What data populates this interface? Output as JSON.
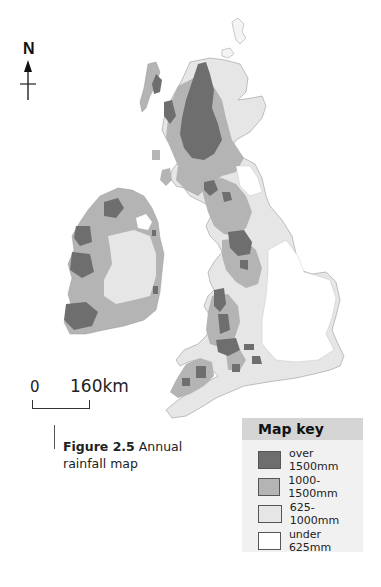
{
  "figure": {
    "number_label": "Figure 2.5",
    "title": "Annual rainfall map"
  },
  "north_arrow": {
    "label": "N"
  },
  "scale_bar": {
    "start_label": "0",
    "end_label": "160km"
  },
  "map_key": {
    "title": "Map key",
    "items": [
      {
        "label": "over 1500mm",
        "color": "#6e6e6e"
      },
      {
        "label": "1000-1500mm",
        "color": "#b4b4b4"
      },
      {
        "label": "625-1000mm",
        "color": "#e6e6e6"
      },
      {
        "label": "under 625mm",
        "color": "#ffffff"
      }
    ]
  },
  "regions": [
    "Scotland",
    "Ireland",
    "England",
    "Wales"
  ]
}
